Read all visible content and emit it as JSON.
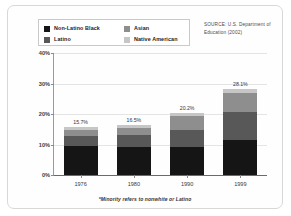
{
  "source_note": "SOURCE: U.S. Department of Education (2002)",
  "footnote": "*Minority refers to nonwhite or Latino",
  "legend": {
    "items": [
      {
        "label": "Non-Latino Black",
        "color": "#151515"
      },
      {
        "label": "Asian",
        "color": "#8e8e8e"
      },
      {
        "label": "Latino",
        "color": "#585858"
      },
      {
        "label": "Native American",
        "color": "#c6c6c6"
      }
    ]
  },
  "chart_data": {
    "type": "bar",
    "stacked": true,
    "title": "",
    "xlabel": "",
    "ylabel": "",
    "categories": [
      "1976",
      "1980",
      "1990",
      "1999"
    ],
    "ylim": [
      0,
      40
    ],
    "yticks": [
      "0%",
      "10%",
      "20%",
      "30%",
      "40%"
    ],
    "ytick_values": [
      0,
      10,
      20,
      30,
      40
    ],
    "grid": true,
    "legend_position": "top-left",
    "series": [
      {
        "name": "Non-Latino Black",
        "color": "#151515",
        "values": [
          9.4,
          9.2,
          9.2,
          11.4
        ]
      },
      {
        "name": "Latino",
        "color": "#585858",
        "values": [
          3.5,
          3.9,
          5.7,
          9.2
        ]
      },
      {
        "name": "Asian",
        "color": "#8e8e8e",
        "values": [
          1.8,
          2.4,
          4.3,
          6.4
        ]
      },
      {
        "name": "Native American",
        "color": "#c6c6c6",
        "values": [
          1.0,
          1.0,
          1.0,
          1.1
        ]
      }
    ],
    "totals": [
      "15.7%",
      "16.5%",
      "20.2%",
      "28.1%"
    ],
    "total_values": [
      15.7,
      16.5,
      20.2,
      28.1
    ]
  }
}
